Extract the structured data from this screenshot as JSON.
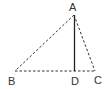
{
  "diagram": {
    "type": "geometry-triangle",
    "points": {
      "A": {
        "label": "A",
        "x": 74,
        "y": 15
      },
      "B": {
        "label": "B",
        "x": 15,
        "y": 71
      },
      "C": {
        "label": "C",
        "x": 95,
        "y": 71
      },
      "D": {
        "label": "D",
        "x": 75,
        "y": 71
      }
    },
    "segments": [
      {
        "from": "A",
        "to": "B",
        "style": "dashed"
      },
      {
        "from": "A",
        "to": "C",
        "style": "dashed"
      },
      {
        "from": "B",
        "to": "C",
        "style": "dashed"
      },
      {
        "from": "A",
        "to": "D",
        "style": "solid"
      }
    ],
    "colors": {
      "line": "#333333",
      "label": "#333333"
    }
  }
}
